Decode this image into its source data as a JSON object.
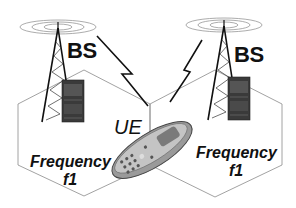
{
  "diagram": {
    "labels": {
      "bs_left": "BS",
      "bs_right": "BS",
      "ue": "UE",
      "freq_left_line1": "Frequency",
      "freq_left_line2": "f1",
      "freq_right_line1": "Frequency",
      "freq_right_line2": "f1"
    },
    "nodes": [
      {
        "id": "bs-left",
        "type": "base-station-tower",
        "label": "BS"
      },
      {
        "id": "bs-right",
        "type": "base-station-tower",
        "label": "BS"
      },
      {
        "id": "ue",
        "type": "mobile-phone",
        "label": "UE"
      }
    ],
    "cells": [
      {
        "id": "cell-left",
        "shape": "hexagon",
        "label": "Frequency f1"
      },
      {
        "id": "cell-right",
        "shape": "hexagon",
        "label": "Frequency f1"
      }
    ],
    "links": [
      {
        "from": "bs-left",
        "to": "ue",
        "style": "lightning-bolt"
      },
      {
        "from": "bs-right",
        "to": "ue",
        "style": "lightning-bolt"
      }
    ],
    "colors": {
      "line": "#111111",
      "hex_outline": "#8a8a8a",
      "cabinet": "#3a3a3a",
      "phone_body": "#9a9a9a"
    }
  }
}
